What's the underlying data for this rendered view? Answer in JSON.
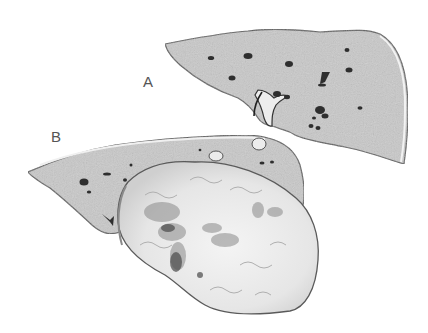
{
  "figure": {
    "labels": {
      "a": "A",
      "b": "B"
    },
    "panels": [
      {
        "id": "A",
        "description": "normal liver cross-section"
      },
      {
        "id": "B",
        "description": "liver cross-section with large tumor mass"
      }
    ],
    "colors": {
      "background": "#ffffff",
      "parenchyma": "#c8c8c8",
      "outline": "#555555",
      "vessel": "#2e2e2e",
      "tumor": "#ececec",
      "tumor_dark": "#7a7a7a",
      "label": "#555555"
    }
  }
}
